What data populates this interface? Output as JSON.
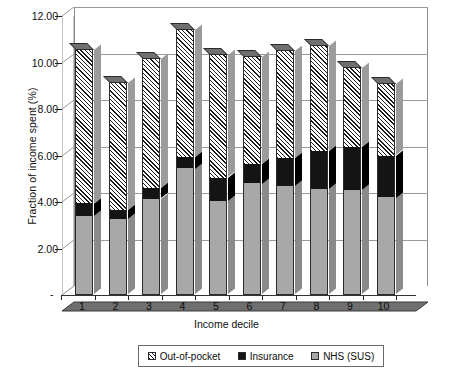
{
  "chart_data": {
    "type": "bar",
    "subtype": "stacked-column-3d",
    "title": "",
    "xlabel": "Income decile",
    "ylabel": "Fraction of income spent (%)",
    "categories": [
      "1",
      "2",
      "3",
      "4",
      "5",
      "6",
      "7",
      "8",
      "9",
      "10"
    ],
    "ylim": [
      0,
      12
    ],
    "ytick_values": [
      0,
      2,
      4,
      6,
      8,
      10,
      12
    ],
    "ytick_labels": [
      "-",
      "2.00",
      "4.00",
      "6.00",
      "8.00",
      "10.00",
      "12.00"
    ],
    "grid": true,
    "legend_position": "bottom",
    "stack_order_bottom_to_top": [
      "NHS (SUS)",
      "Insurance",
      "Out-of-pocket"
    ],
    "series": [
      {
        "name": "NHS (SUS)",
        "fill": "solid-gray",
        "color": "#a8a8a8",
        "values": [
          3.4,
          3.25,
          4.15,
          5.45,
          4.05,
          4.8,
          4.7,
          4.55,
          4.5,
          4.2
        ]
      },
      {
        "name": "Insurance",
        "fill": "solid-black",
        "color": "#141414",
        "values": [
          0.55,
          0.4,
          0.45,
          0.5,
          1.0,
          0.85,
          1.2,
          1.65,
          1.85,
          1.8
        ]
      },
      {
        "name": "Out-of-pocket",
        "fill": "diagonal-hatch",
        "color": "#1c1c1c",
        "values": [
          6.65,
          5.5,
          5.6,
          5.5,
          5.3,
          4.65,
          4.65,
          4.55,
          3.45,
          3.1
        ]
      }
    ],
    "totals": [
      10.6,
      9.15,
      10.2,
      11.45,
      10.35,
      10.3,
      10.55,
      10.75,
      9.8,
      9.1
    ]
  },
  "legend": {
    "entries": [
      {
        "label": "Out-of-pocket",
        "swatch": "hatch-swatch"
      },
      {
        "label": "Insurance",
        "swatch": "black-swatch"
      },
      {
        "label": "NHS (SUS)",
        "swatch": "gray-swatch"
      }
    ]
  },
  "axes": {
    "y_title": "Fraction of income spent (%)",
    "x_title": "Income decile",
    "zero_label": "-"
  },
  "colors": {
    "nhs": "#a8a8a8",
    "insurance": "#141414",
    "outofpocket": "#1c1c1c",
    "gridline": "#9a9a9a",
    "floor": "#6f6f6f",
    "text": "#0d0d0d"
  }
}
